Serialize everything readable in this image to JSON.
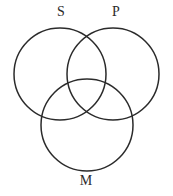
{
  "diagram": {
    "type": "venn-three-circle",
    "title": "",
    "background_color": "#ffffff",
    "stroke_color": "#2b2b2b",
    "stroke_width": 1.5,
    "circles": [
      {
        "id": "s",
        "label": "S",
        "cx": 60,
        "cy": 74,
        "r": 46
      },
      {
        "id": "p",
        "label": "P",
        "cx": 113,
        "cy": 74,
        "r": 46
      },
      {
        "id": "m",
        "label": "M",
        "cx": 87,
        "cy": 125,
        "r": 46
      }
    ],
    "labels": {
      "s": "S",
      "p": "P",
      "m": "M"
    }
  }
}
